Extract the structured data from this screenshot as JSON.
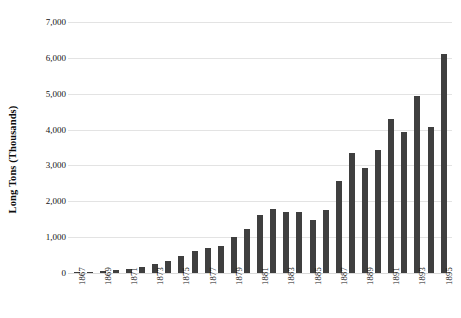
{
  "chart_data": {
    "type": "bar",
    "title": "",
    "xlabel": "",
    "ylabel": "Long Tons (Thousands)",
    "ylim": [
      0,
      7000
    ],
    "ytick_labels": [
      "7,000",
      "6,000",
      "5,000",
      "4,000",
      "3,000",
      "2,000",
      "1,000",
      "0"
    ],
    "ytick_values": [
      7000,
      6000,
      5000,
      4000,
      3000,
      2000,
      1000,
      0
    ],
    "grid": "horizontal",
    "legend": "none",
    "bar_color": "#3f3f3f",
    "categories": [
      "1867",
      "1868",
      "1869",
      "1870",
      "1871",
      "1872",
      "1873",
      "1874",
      "1875",
      "1876",
      "1877",
      "1878",
      "1879",
      "1880",
      "1881",
      "1882",
      "1883",
      "1884",
      "1885",
      "1886",
      "1887",
      "1888",
      "1889",
      "1890",
      "1891",
      "1892",
      "1893",
      "1894",
      "1895"
    ],
    "tick_labels_shown": [
      "1867",
      "",
      "1869",
      "",
      "1871",
      "",
      "1873",
      "",
      "1875",
      "",
      "1877",
      "",
      "1879",
      "",
      "1881",
      "",
      "1883",
      "",
      "1885",
      "",
      "1887",
      "",
      "1889",
      "",
      "1891",
      "",
      "1893",
      "",
      "1895"
    ],
    "values": [
      20,
      40,
      60,
      90,
      120,
      170,
      250,
      330,
      480,
      610,
      700,
      760,
      1010,
      1230,
      1620,
      1780,
      1690,
      1690,
      1480,
      1760,
      2580,
      3350,
      2940,
      3420,
      4290,
      3930,
      4940,
      4060,
      4440
    ],
    "values_note": "estimated from axis gridlines, long tons in thousands",
    "last_value": 6110
  }
}
